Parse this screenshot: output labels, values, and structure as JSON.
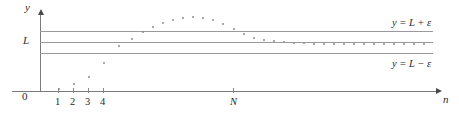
{
  "figure": {
    "axes": {
      "y_label": "y",
      "x_label": "n",
      "origin_label": "0"
    },
    "colors": {
      "line": "#9a9a9a",
      "axis": "#7a7a7a",
      "dot": "#8d8d8d",
      "text": "#2b2b2b",
      "background": "#ffffff"
    },
    "band_labels": {
      "upper": "y = L + ε",
      "center": "L",
      "lower": "y = L − ε"
    },
    "x_ticks": [
      {
        "label": "1",
        "x": 58
      },
      {
        "label": "2",
        "x": 73
      },
      {
        "label": "3",
        "x": 88
      },
      {
        "label": "4",
        "x": 103
      },
      {
        "label": "N",
        "x": 233
      }
    ],
    "lines": [
      {
        "name": "upper-band-line",
        "y": 31,
        "label": "y = L + ε"
      },
      {
        "name": "limit-line",
        "y": 42,
        "label": "L"
      },
      {
        "name": "lower-band-line",
        "y": 53,
        "label": "y = L − ε"
      }
    ]
  },
  "chart_data": {
    "type": "scatter",
    "title": "",
    "xlabel": "n",
    "ylabel": "y",
    "xlim": [
      0,
      459
    ],
    "ylim": [
      0,
      116
    ],
    "grid": false,
    "legend": null,
    "annotations": [
      {
        "text": "y = L + ε",
        "x": 392,
        "y": 24
      },
      {
        "text": "L",
        "x": 23,
        "y": 37
      },
      {
        "text": "y = L − ε",
        "x": 392,
        "y": 62
      },
      {
        "text": "0",
        "x": 22,
        "y": 92
      },
      {
        "text": "1",
        "x": 55,
        "y": 98
      },
      {
        "text": "2",
        "x": 70,
        "y": 98
      },
      {
        "text": "3",
        "x": 85,
        "y": 98
      },
      {
        "text": "4",
        "x": 100,
        "y": 98
      },
      {
        "text": "N",
        "x": 229,
        "y": 98
      },
      {
        "text": "n",
        "x": 443,
        "y": 95
      },
      {
        "text": "y",
        "x": 25,
        "y": 3
      }
    ],
    "reference_lines": [
      31,
      42,
      53
    ],
    "points": [
      {
        "n": 1,
        "x": 58,
        "y": 88
      },
      {
        "n": 2,
        "x": 73,
        "y": 83
      },
      {
        "n": 3,
        "x": 88,
        "y": 76
      },
      {
        "n": 4,
        "x": 103,
        "y": 62
      },
      {
        "n": 5,
        "x": 118,
        "y": 45
      },
      {
        "n": 6,
        "x": 131,
        "y": 38
      },
      {
        "n": 7,
        "x": 142,
        "y": 31
      },
      {
        "n": 8,
        "x": 152,
        "y": 26
      },
      {
        "n": 9,
        "x": 162,
        "y": 22
      },
      {
        "n": 10,
        "x": 172,
        "y": 19
      },
      {
        "n": 11,
        "x": 182,
        "y": 17
      },
      {
        "n": 12,
        "x": 192,
        "y": 16
      },
      {
        "n": 13,
        "x": 202,
        "y": 17
      },
      {
        "n": 14,
        "x": 212,
        "y": 19
      },
      {
        "n": 15,
        "x": 222,
        "y": 23
      },
      {
        "n": 16,
        "x": 233,
        "y": 28
      },
      {
        "n": 17,
        "x": 243,
        "y": 33
      },
      {
        "n": 18,
        "x": 253,
        "y": 37
      },
      {
        "n": 19,
        "x": 263,
        "y": 39
      },
      {
        "n": 20,
        "x": 273,
        "y": 40
      },
      {
        "n": 21,
        "x": 283,
        "y": 41
      },
      {
        "n": 22,
        "x": 293,
        "y": 42
      },
      {
        "n": 23,
        "x": 303,
        "y": 42
      },
      {
        "n": 24,
        "x": 313,
        "y": 43
      },
      {
        "n": 25,
        "x": 323,
        "y": 43
      },
      {
        "n": 26,
        "x": 333,
        "y": 43
      },
      {
        "n": 27,
        "x": 343,
        "y": 43
      },
      {
        "n": 28,
        "x": 353,
        "y": 43
      },
      {
        "n": 29,
        "x": 363,
        "y": 43
      },
      {
        "n": 30,
        "x": 373,
        "y": 43
      },
      {
        "n": 31,
        "x": 383,
        "y": 43
      },
      {
        "n": 32,
        "x": 393,
        "y": 43
      },
      {
        "n": 33,
        "x": 403,
        "y": 43
      },
      {
        "n": 34,
        "x": 413,
        "y": 43
      },
      {
        "n": 35,
        "x": 423,
        "y": 43
      }
    ]
  }
}
